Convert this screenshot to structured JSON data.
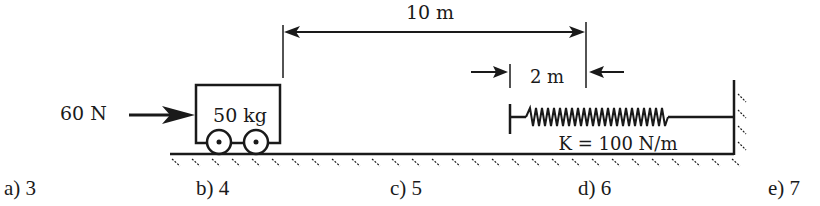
{
  "diagram": {
    "force_label": "60 N",
    "mass_label": "50 kg",
    "distance_label": "10 m",
    "compression_label": "2 m",
    "spring_label": "K = 100 N/m",
    "ink_color": "#1a1a1a"
  },
  "answers": [
    {
      "letter": "a)",
      "value": "3"
    },
    {
      "letter": "b)",
      "value": "4"
    },
    {
      "letter": "c)",
      "value": "5"
    },
    {
      "letter": "d)",
      "value": "6"
    },
    {
      "letter": "e)",
      "value": "7"
    }
  ]
}
